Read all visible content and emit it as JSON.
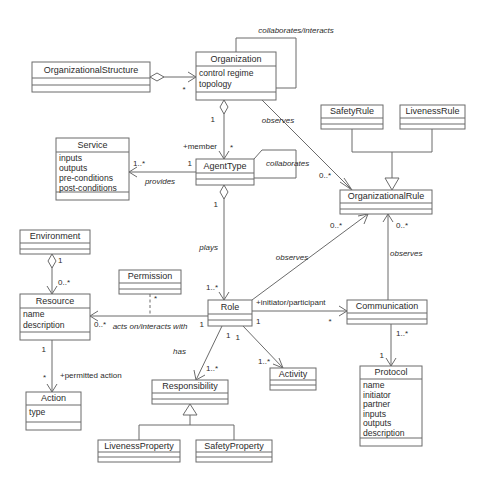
{
  "diagram": {
    "type": "uml-class-diagram",
    "caption": "",
    "canvas": {
      "width": 488,
      "height": 483
    },
    "style": {
      "box_fill": "#ffffff",
      "box_stroke": "#6b6b6b",
      "text_color": "#2b2b2b",
      "background": "#ffffff"
    }
  },
  "classes": [
    {
      "id": "organizational-structure",
      "name": "OrganizationalStructure",
      "attributes": [],
      "x": 32,
      "y": 62,
      "w": 118,
      "h": 30,
      "name_h": 16
    },
    {
      "id": "organization",
      "name": "Organization",
      "attributes": [
        "control regime",
        "topology"
      ],
      "x": 196,
      "y": 52,
      "w": 80,
      "h": 48,
      "name_h": 14
    },
    {
      "id": "service",
      "name": "Service",
      "attributes": [
        "inputs",
        "outputs",
        "pre-conditions",
        "post-conditions"
      ],
      "x": 56,
      "y": 138,
      "w": 73,
      "h": 62,
      "name_h": 14
    },
    {
      "id": "agent-type",
      "name": "AgentType",
      "attributes": [],
      "x": 196,
      "y": 159,
      "w": 58,
      "h": 26,
      "name_h": 14
    },
    {
      "id": "safety-rule",
      "name": "SafetyRule",
      "attributes": [],
      "x": 321,
      "y": 105,
      "w": 62,
      "h": 24,
      "name_h": 13
    },
    {
      "id": "liveness-rule",
      "name": "LivenessRule",
      "attributes": [],
      "x": 400,
      "y": 105,
      "w": 65,
      "h": 24,
      "name_h": 13
    },
    {
      "id": "organizational-rule",
      "name": "OrganizationalRule",
      "attributes": [],
      "x": 340,
      "y": 190,
      "w": 92,
      "h": 24,
      "name_h": 13
    },
    {
      "id": "environment",
      "name": "Environment",
      "attributes": [],
      "x": 20,
      "y": 230,
      "w": 70,
      "h": 24,
      "name_h": 13
    },
    {
      "id": "permission",
      "name": "Permission",
      "attributes": [],
      "x": 119,
      "y": 270,
      "w": 62,
      "h": 24,
      "name_h": 13
    },
    {
      "id": "resource",
      "name": "Resource",
      "attributes": [
        "name",
        "description"
      ],
      "x": 20,
      "y": 294,
      "w": 70,
      "h": 46,
      "name_h": 14
    },
    {
      "id": "role",
      "name": "Role",
      "attributes": [],
      "x": 208,
      "y": 300,
      "w": 44,
      "h": 26,
      "name_h": 14
    },
    {
      "id": "communication",
      "name": "Communication",
      "attributes": [],
      "x": 347,
      "y": 300,
      "w": 80,
      "h": 24,
      "name_h": 13
    },
    {
      "id": "action",
      "name": "Action",
      "attributes": [
        "type"
      ],
      "x": 26,
      "y": 392,
      "w": 55,
      "h": 38,
      "name_h": 13
    },
    {
      "id": "responsibility",
      "name": "Responsibility",
      "attributes": [],
      "x": 152,
      "y": 380,
      "w": 76,
      "h": 24,
      "name_h": 13
    },
    {
      "id": "activity",
      "name": "Activity",
      "attributes": [],
      "x": 270,
      "y": 368,
      "w": 46,
      "h": 22,
      "name_h": 12
    },
    {
      "id": "protocol",
      "name": "Protocol",
      "attributes": [
        "name",
        "initiator",
        "partner",
        "inputs",
        "outputs",
        "description"
      ],
      "x": 360,
      "y": 366,
      "w": 62,
      "h": 80,
      "name_h": 13
    },
    {
      "id": "liveness-property",
      "name": "LivenessProperty",
      "attributes": [],
      "x": 98,
      "y": 440,
      "w": 82,
      "h": 22,
      "name_h": 12
    },
    {
      "id": "safety-property",
      "name": "SafetyProperty",
      "attributes": [],
      "x": 196,
      "y": 440,
      "w": 76,
      "h": 22,
      "name_h": 12
    }
  ],
  "associations": [
    {
      "id": "orgstructure-organization",
      "from": "organizational-structure",
      "to": "organization",
      "label": "",
      "kind": "aggregation",
      "source_mult": "",
      "target_mult": "*"
    },
    {
      "id": "organization-self",
      "from": "organization",
      "to": "organization",
      "label": "collaborates/interacts",
      "kind": "association",
      "source_mult": "",
      "target_mult": ""
    },
    {
      "id": "organization-agenttype",
      "from": "organization",
      "to": "agent-type",
      "label": "",
      "kind": "aggregation",
      "source_mult": "1",
      "target_mult": "*",
      "role_label": "+member"
    },
    {
      "id": "agenttype-self",
      "from": "agent-type",
      "to": "agent-type",
      "label": "collaborates",
      "kind": "association",
      "source_mult": "",
      "target_mult": ""
    },
    {
      "id": "agenttype-service",
      "from": "agent-type",
      "to": "service",
      "label": "provides",
      "kind": "association",
      "source_mult": "1",
      "target_mult": "1..*"
    },
    {
      "id": "organization-orgrule",
      "from": "organization",
      "to": "organizational-rule",
      "label": "observes",
      "kind": "association",
      "source_mult": "",
      "target_mult": "0..*"
    },
    {
      "id": "safetyrule-orgrule",
      "from": "safety-rule",
      "to": "organizational-rule",
      "label": "",
      "kind": "generalization",
      "source_mult": "",
      "target_mult": ""
    },
    {
      "id": "livenessrule-orgrule",
      "from": "liveness-rule",
      "to": "organizational-rule",
      "label": "",
      "kind": "generalization",
      "source_mult": "",
      "target_mult": ""
    },
    {
      "id": "agenttype-role",
      "from": "agent-type",
      "to": "role",
      "label": "plays",
      "kind": "aggregation",
      "source_mult": "1",
      "target_mult": "1..*"
    },
    {
      "id": "role-orgrule",
      "from": "role",
      "to": "organizational-rule",
      "label": "observes",
      "kind": "association",
      "source_mult": "",
      "target_mult": "0..*"
    },
    {
      "id": "communication-orgrule",
      "from": "communication",
      "to": "organizational-rule",
      "label": "observes",
      "kind": "association",
      "source_mult": "",
      "target_mult": "0..*"
    },
    {
      "id": "environment-resource",
      "from": "environment",
      "to": "resource",
      "label": "",
      "kind": "aggregation",
      "source_mult": "1",
      "target_mult": "0..*"
    },
    {
      "id": "role-resource",
      "from": "role",
      "to": "resource",
      "label": "acts on/interacts with",
      "kind": "association",
      "source_mult": "1",
      "target_mult": "0..*"
    },
    {
      "id": "permission-link",
      "from": "permission",
      "to": "role-resource",
      "label": "",
      "kind": "dependency",
      "source_mult": "",
      "target_mult": "*"
    },
    {
      "id": "resource-action",
      "from": "resource",
      "to": "action",
      "label": "",
      "kind": "association",
      "source_mult": "1",
      "target_mult": "*",
      "role_label": "+permitted action"
    },
    {
      "id": "role-communication",
      "from": "role",
      "to": "communication",
      "label": "",
      "kind": "association",
      "source_mult": "1",
      "target_mult": "*",
      "role_label": "+initiator/participant"
    },
    {
      "id": "role-responsibility",
      "from": "role",
      "to": "responsibility",
      "label": "has",
      "kind": "association",
      "source_mult": "1",
      "target_mult": "1..*"
    },
    {
      "id": "role-activity",
      "from": "role",
      "to": "activity",
      "label": "",
      "kind": "association",
      "source_mult": "1",
      "target_mult": "1..*"
    },
    {
      "id": "communication-protocol",
      "from": "communication",
      "to": "protocol",
      "label": "",
      "kind": "association",
      "source_mult": "1..*",
      "target_mult": "1"
    },
    {
      "id": "livenessproperty-responsibility",
      "from": "liveness-property",
      "to": "responsibility",
      "label": "",
      "kind": "generalization",
      "source_mult": "",
      "target_mult": ""
    },
    {
      "id": "safetyproperty-responsibility",
      "from": "safety-property",
      "to": "responsibility",
      "label": "",
      "kind": "generalization",
      "source_mult": "",
      "target_mult": ""
    }
  ],
  "labels": {
    "collaborates_interacts": "collaborates/interacts",
    "collaborates": "collaborates",
    "provides": "provides",
    "observes": "observes",
    "plays": "plays",
    "has": "has",
    "acts_on": "acts on/interacts with",
    "member": "+member",
    "permitted_action": "+permitted action",
    "initiator_participant": "+initiator/participant"
  },
  "multiplicities": {
    "one": "1",
    "star": "*",
    "one_star": "1..*",
    "zero_star": "0..*"
  }
}
